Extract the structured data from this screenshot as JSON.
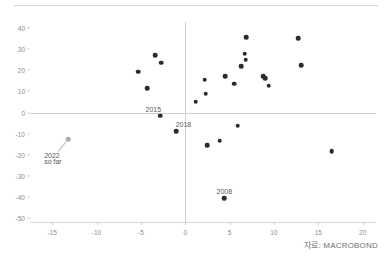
{
  "header": {
    "clipped_text": ""
  },
  "source": {
    "label": "자료: MACROBOND"
  },
  "chart_data": {
    "type": "scatter",
    "title": "",
    "subtitle": "",
    "xlabel": "",
    "ylabel": "",
    "xlim": [
      -17.5,
      21.5
    ],
    "ylim": [
      -52,
      43
    ],
    "xticks": [
      -15,
      -10,
      -5,
      0,
      5,
      10,
      15,
      20
    ],
    "xticklabels": [
      "-15",
      "-10",
      "-5",
      "0",
      "5",
      "10",
      "15",
      "20"
    ],
    "yticks": [
      40,
      30,
      20,
      10,
      0,
      -10,
      -20,
      -30,
      -40,
      -50
    ],
    "yticklabels": [
      "40",
      "30",
      "20",
      "10",
      "0",
      "-10",
      "-20",
      "-30",
      "-40",
      "-50"
    ],
    "grid": false,
    "zero_lines": {
      "x": 0,
      "y": 0
    },
    "legend": null,
    "marker_color": "#2b2b2b",
    "highlight_color": "#a9a9a9",
    "points": [
      {
        "x": -13.2,
        "y": -12.6,
        "label": "2022 so far",
        "highlight": true
      },
      {
        "x": -5.3,
        "y": 19.4,
        "label": "",
        "highlight": false
      },
      {
        "x": -4.3,
        "y": 11.6,
        "label": "",
        "highlight": false
      },
      {
        "x": -3.4,
        "y": 27.2,
        "label": "",
        "highlight": false
      },
      {
        "x": -2.7,
        "y": 23.7,
        "label": "",
        "highlight": false
      },
      {
        "x": -2.8,
        "y": -1.6,
        "label": "2015",
        "highlight": false
      },
      {
        "x": -1.0,
        "y": -8.8,
        "label": "2018",
        "highlight": false
      },
      {
        "x": 1.2,
        "y": 5.1,
        "label": "",
        "highlight": false
      },
      {
        "x": 2.2,
        "y": 15.5,
        "label": "",
        "highlight": false
      },
      {
        "x": 2.3,
        "y": 9.0,
        "label": "",
        "highlight": false
      },
      {
        "x": 2.5,
        "y": -15.5,
        "label": "",
        "highlight": false
      },
      {
        "x": 3.9,
        "y": -13.3,
        "label": "",
        "highlight": false
      },
      {
        "x": 4.4,
        "y": -40.8,
        "label": "2008",
        "highlight": false
      },
      {
        "x": 4.5,
        "y": 17.2,
        "label": "",
        "highlight": false
      },
      {
        "x": 5.5,
        "y": 13.6,
        "label": "",
        "highlight": false
      },
      {
        "x": 5.9,
        "y": -6.2,
        "label": "",
        "highlight": false
      },
      {
        "x": 6.3,
        "y": 22.1,
        "label": "",
        "highlight": false
      },
      {
        "x": 6.7,
        "y": 28.0,
        "label": "",
        "highlight": false
      },
      {
        "x": 6.8,
        "y": 25.0,
        "label": "",
        "highlight": false
      },
      {
        "x": 6.9,
        "y": 35.8,
        "label": "",
        "highlight": false
      },
      {
        "x": 8.8,
        "y": 17.2,
        "label": "",
        "highlight": false
      },
      {
        "x": 9.0,
        "y": 16.4,
        "label": "",
        "highlight": false
      },
      {
        "x": 9.4,
        "y": 12.7,
        "label": "",
        "highlight": false
      },
      {
        "x": 12.7,
        "y": 35.2,
        "label": "",
        "highlight": false
      },
      {
        "x": 13.1,
        "y": 22.6,
        "label": "",
        "highlight": false
      },
      {
        "x": 16.5,
        "y": -18.4,
        "label": "",
        "highlight": false
      }
    ],
    "annotations": [
      {
        "text": "2015",
        "x": -3.6,
        "y": 3.2,
        "align": "center",
        "leader": false
      },
      {
        "text": "2018",
        "x": -0.2,
        "y": -4.2,
        "align": "center",
        "leader": false
      },
      {
        "text": "2008",
        "x": 4.4,
        "y": -36.0,
        "align": "center",
        "leader": false
      },
      {
        "text": "2022",
        "x": -15.9,
        "y": -18.6,
        "align": "left",
        "leader": true
      },
      {
        "text": "so far",
        "x": -15.9,
        "y": -21.6,
        "align": "left",
        "leader": false
      }
    ]
  }
}
